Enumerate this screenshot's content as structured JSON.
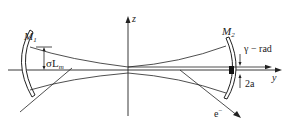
{
  "diagram": {
    "labels": {
      "m1": "M",
      "m1_sub": "1",
      "m2": "M",
      "m2_sub": "2",
      "z_axis": "z",
      "y_axis": "y",
      "sigma_lm": "σL",
      "sigma_lm_sub": "m",
      "gamma_rad": "γ − rad",
      "aperture": "2a",
      "electron": "e",
      "electron_sup": "−"
    },
    "colors": {
      "stroke": "#222222",
      "background": "#ffffff"
    }
  }
}
